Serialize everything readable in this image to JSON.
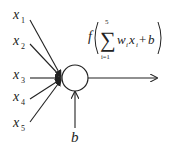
{
  "diagram": {
    "type": "perceptron-neuron",
    "inputs": [
      {
        "var": "x",
        "sub": "1"
      },
      {
        "var": "x",
        "sub": "2"
      },
      {
        "var": "x",
        "sub": "3"
      },
      {
        "var": "x",
        "sub": "4"
      },
      {
        "var": "x",
        "sub": "5"
      }
    ],
    "bias": {
      "label": "b"
    },
    "formula": {
      "func": "f",
      "sum_symbol": "∑",
      "upper": "5",
      "lower": "i=1",
      "weight": "w",
      "weight_sub": "i",
      "input": "x",
      "input_sub": "i",
      "plus": "+",
      "bias": "b"
    },
    "colors": {
      "stroke": "#222222",
      "background": "#ffffff"
    }
  }
}
